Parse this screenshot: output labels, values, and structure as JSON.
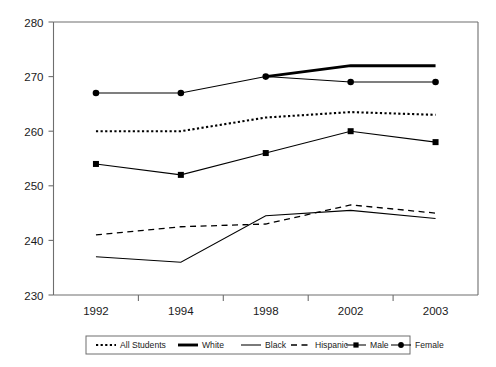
{
  "chart_data": {
    "type": "line",
    "title": "",
    "subtitle": "",
    "xlabel": "",
    "ylabel": "",
    "grid": false,
    "legend_position": "bottom",
    "categories": [
      "1992",
      "1994",
      "1998",
      "2002",
      "2003"
    ],
    "ylim": [
      230,
      280
    ],
    "y_ticks": [
      230,
      240,
      250,
      260,
      270,
      280
    ],
    "y_tick_labels": [
      "230",
      "240",
      "250",
      "260",
      "270",
      "280"
    ],
    "x_tick_labels": [
      "1992",
      "1994",
      "1998",
      "2002",
      "2003"
    ],
    "series": [
      {
        "name": "All Students",
        "style": "dotted",
        "marker": "none",
        "color": "#000000",
        "values": [
          260,
          260,
          262.5,
          263.5,
          263
        ]
      },
      {
        "name": "White",
        "style": "thick-solid",
        "marker": "none",
        "color": "#000000",
        "values": [
          null,
          null,
          270,
          272,
          272
        ]
      },
      {
        "name": "Black",
        "style": "solid",
        "marker": "none",
        "color": "#000000",
        "values": [
          237,
          236,
          244.5,
          245.5,
          244
        ]
      },
      {
        "name": "Hispanic",
        "style": "dashed",
        "marker": "none",
        "color": "#000000",
        "values": [
          241,
          242.5,
          243,
          246.5,
          245
        ]
      },
      {
        "name": "Male",
        "style": "solid",
        "marker": "square",
        "color": "#000000",
        "values": [
          254,
          252,
          256,
          260,
          258
        ]
      },
      {
        "name": "Female",
        "style": "solid",
        "marker": "circle",
        "color": "#000000",
        "values": [
          267,
          267,
          270,
          269,
          269
        ]
      }
    ]
  },
  "legend": {
    "entries": [
      {
        "label": "All Students",
        "style": "dotted",
        "marker": "none"
      },
      {
        "label": "White",
        "style": "thick-solid",
        "marker": "none"
      },
      {
        "label": "Black",
        "style": "solid",
        "marker": "none"
      },
      {
        "label": "Hispanic",
        "style": "dashed",
        "marker": "none"
      },
      {
        "label": "Male",
        "style": "solid",
        "marker": "square"
      },
      {
        "label": "Female",
        "style": "solid",
        "marker": "circle"
      }
    ]
  },
  "colors": {
    "ink": "#000000",
    "axis": "#6e6e6e",
    "background": "#ffffff"
  }
}
